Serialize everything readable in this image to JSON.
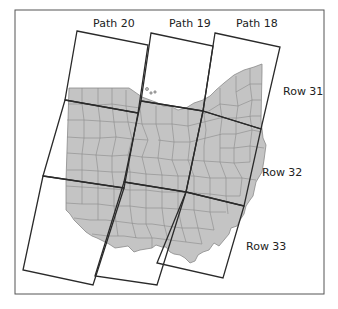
{
  "figure": {
    "type": "Landsat WRS-2 path/row coverage map",
    "region": "Ohio",
    "colors": {
      "background": "#ffffff",
      "frame_border": "#555555",
      "state_fill": "#c4c4c4",
      "county_lines": "#8a8a8a",
      "scene_lines": "#2a2a2a",
      "label_text": "#222222"
    }
  },
  "paths": [
    {
      "label": "Path 20"
    },
    {
      "label": "Path 19"
    },
    {
      "label": "Path 18"
    }
  ],
  "rows": [
    {
      "label": "Row 31"
    },
    {
      "label": "Row 32"
    },
    {
      "label": "Row 33"
    }
  ]
}
